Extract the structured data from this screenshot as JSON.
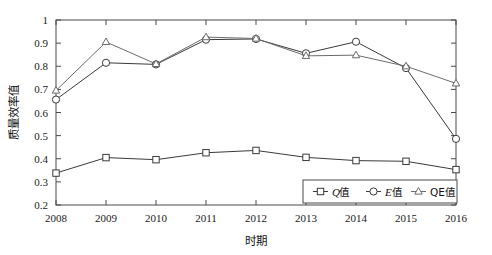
{
  "chart_data": {
    "type": "line",
    "title": "",
    "xlabel": "时期",
    "ylabel": "质量效率值",
    "x": [
      2008,
      2009,
      2010,
      2011,
      2012,
      2013,
      2014,
      2015,
      2016
    ],
    "categories": [
      "2008",
      "2009",
      "2010",
      "2011",
      "2012",
      "2013",
      "2014",
      "2015",
      "2016"
    ],
    "xlim": [
      2008,
      2016
    ],
    "ylim": [
      0.2,
      1
    ],
    "yticks": [
      "0.2",
      "0.3",
      "0.4",
      "0.5",
      "0.6",
      "0.7",
      "0.8",
      "0.9",
      "1"
    ],
    "ytick_values": [
      0.2,
      0.3,
      0.4,
      0.5,
      0.6,
      0.7,
      0.8,
      0.9,
      1.0
    ],
    "grid": false,
    "legend_position": "bottom-right",
    "series": [
      {
        "name": "Q值",
        "marker": "square",
        "color": "#3a3a3a",
        "values": [
          0.338,
          0.405,
          0.396,
          0.426,
          0.436,
          0.406,
          0.392,
          0.389,
          0.353
        ]
      },
      {
        "name": "E值",
        "marker": "circle",
        "color": "#3a3a3a",
        "values": [
          0.656,
          0.815,
          0.808,
          0.915,
          0.918,
          0.856,
          0.906,
          0.792,
          0.486
        ]
      },
      {
        "name": "QE值",
        "marker": "triangle",
        "color": "#6b6b6b",
        "values": [
          0.695,
          0.905,
          0.81,
          0.926,
          0.92,
          0.845,
          0.848,
          0.8,
          0.726
        ]
      }
    ]
  },
  "legend": {
    "items": [
      {
        "label_italic": "Q",
        "label_rest": "值",
        "marker": "square"
      },
      {
        "label_italic": "E",
        "label_rest": "值",
        "marker": "circle"
      },
      {
        "label_italic": "",
        "label_rest": "QE值",
        "marker": "triangle"
      }
    ]
  },
  "axes": {
    "x_title": "时期",
    "y_title": "质量效率值"
  }
}
